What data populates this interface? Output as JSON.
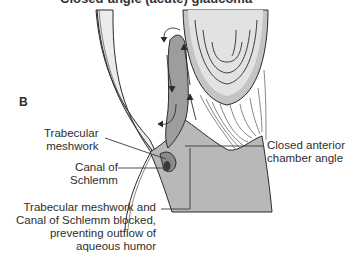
{
  "figure": {
    "title_clipped": "Closed-angle (acute) glaucoma",
    "panel_label": "B",
    "labels": {
      "trabecular_meshwork": [
        "Trabecular",
        "meshwork"
      ],
      "canal_of_schlemm": [
        "Canal of",
        "Schlemm"
      ],
      "closed_angle": [
        "Closed anterior",
        "chamber angle"
      ],
      "blocked": [
        "Trabecular meshwork and",
        "Canal of Schlemm blocked,",
        "preventing outflow of",
        "aqueous humor"
      ]
    },
    "structures": [
      "cornea",
      "lens",
      "iris",
      "ciliary body",
      "zonular fibers",
      "aqueous flow arrows"
    ],
    "colors": {
      "cornea_fill": "#ececec",
      "iris_fill": "#9d9d9d",
      "ciliary_fill": "#b8b8b8",
      "lens_outer": "#c4c4c4",
      "lens_inner": "#e2e2e2",
      "line": "#2b2b2b"
    }
  }
}
